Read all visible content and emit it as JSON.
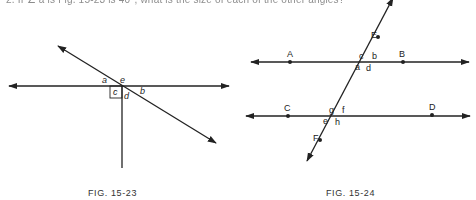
{
  "header": {
    "partial_text": "2. If ∠ a is Fig. 15-23 is 40°, what is the size of each of the other angles?"
  },
  "figures": [
    {
      "caption": "FIG. 15-23",
      "labels": {
        "a": "a",
        "b": "b",
        "c": "c",
        "d": "d",
        "e": "e"
      }
    },
    {
      "caption": "FIG. 15-24",
      "points": {
        "A": "A",
        "B": "B",
        "C": "C",
        "D": "D",
        "E": "E",
        "F": "F"
      },
      "angles": {
        "a": "a",
        "b": "b",
        "c": "c",
        "d": "d",
        "e": "e",
        "f": "f",
        "g": "g",
        "h": "h"
      }
    }
  ],
  "colors": {
    "ink": "#222222",
    "background": "#ffffff"
  }
}
